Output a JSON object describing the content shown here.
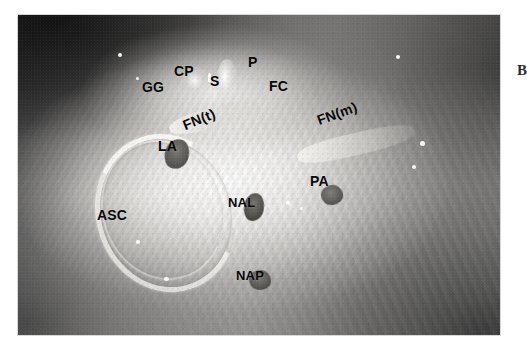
{
  "figure": {
    "type": "anatomical-photograph",
    "modality": "grayscale surgical dissection photograph",
    "panel_letter": "B",
    "photo_frame": {
      "x": 18,
      "y": 15,
      "width": 482,
      "height": 320
    },
    "canvas": {
      "width": 523,
      "height": 353,
      "background": "#ffffff"
    },
    "label_color": "#080808"
  },
  "labels": [
    {
      "id": "GG",
      "text": "GG",
      "meaning": "geniculate ganglion",
      "x": 142,
      "y": 80,
      "rotation": 0,
      "size": 14
    },
    {
      "id": "CP",
      "text": "CP",
      "meaning": "cochleariform process",
      "x": 174,
      "y": 64,
      "rotation": 0,
      "size": 14
    },
    {
      "id": "S",
      "text": "S",
      "meaning": "stapes",
      "x": 210,
      "y": 74,
      "rotation": 0,
      "size": 14
    },
    {
      "id": "P",
      "text": "P",
      "meaning": "promontory",
      "x": 248,
      "y": 55,
      "rotation": 0,
      "size": 14
    },
    {
      "id": "FC",
      "text": "FC",
      "meaning": "facial canal",
      "x": 269,
      "y": 79,
      "rotation": 0,
      "size": 14
    },
    {
      "id": "FNt",
      "text": "FN(t)",
      "meaning": "facial nerve, tympanic segment",
      "x": 186,
      "y": 118,
      "rotation": -22,
      "size": 14
    },
    {
      "id": "FNm",
      "text": "FN(m)",
      "meaning": "facial nerve, mastoid segment",
      "x": 320,
      "y": 113,
      "rotation": -20,
      "size": 14
    },
    {
      "id": "LA",
      "text": "LA",
      "meaning": "lateral ampulla",
      "x": 158,
      "y": 139,
      "rotation": 0,
      "size": 14
    },
    {
      "id": "ASC",
      "text": "ASC",
      "meaning": "anterior semicircular canal",
      "x": 97,
      "y": 208,
      "rotation": 0,
      "size": 14
    },
    {
      "id": "NAL",
      "text": "NAL",
      "meaning": "nerve to ampulla, lateral",
      "x": 228,
      "y": 196,
      "rotation": 0,
      "size": 13
    },
    {
      "id": "PA",
      "text": "PA",
      "meaning": "posterior ampulla",
      "x": 310,
      "y": 174,
      "rotation": 0,
      "size": 14
    },
    {
      "id": "NAP",
      "text": "NAP",
      "meaning": "nerve to ampulla, posterior",
      "x": 236,
      "y": 269,
      "rotation": 0,
      "size": 13
    }
  ],
  "markers": [
    {
      "id": "LA-blob",
      "note": "dark oval marker at lateral ampulla",
      "x": 147,
      "y": 124,
      "w": 24,
      "h": 30,
      "rotation": 18,
      "tone": "#6d6b68"
    },
    {
      "id": "NAL-blob",
      "note": "dark oval marker at lateral ampullary nerve",
      "x": 226,
      "y": 178,
      "w": 20,
      "h": 28,
      "rotation": 10,
      "tone": "#5f5d5a"
    },
    {
      "id": "PA-blob",
      "note": "dark marker at posterior ampulla",
      "x": 303,
      "y": 170,
      "w": 22,
      "h": 20,
      "rotation": -8,
      "tone": "#6a6866"
    },
    {
      "id": "NAP-blob",
      "note": "dark marker at posterior ampullary nerve",
      "x": 231,
      "y": 255,
      "w": 22,
      "h": 20,
      "rotation": 6,
      "tone": "#676562"
    }
  ]
}
